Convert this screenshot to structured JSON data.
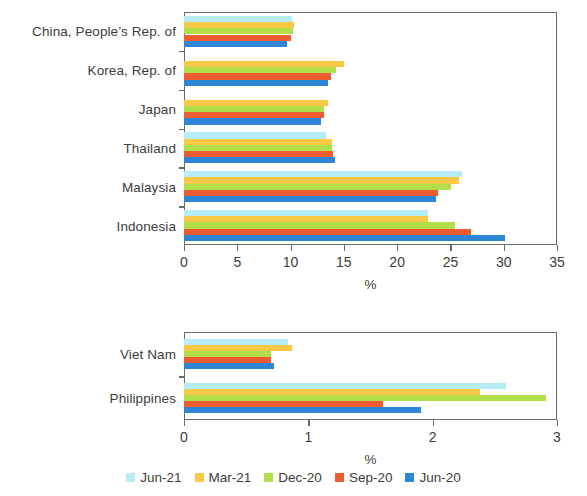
{
  "legend": {
    "position": "bottom-center",
    "entries": [
      {
        "label": "Jun-21",
        "color": "#b6ecf5"
      },
      {
        "label": "Mar-21",
        "color": "#f9c846"
      },
      {
        "label": "Dec-20",
        "color": "#b2de4a"
      },
      {
        "label": "Sep-20",
        "color": "#f05c32"
      },
      {
        "label": "Jun-20",
        "color": "#2e86d6"
      }
    ]
  },
  "chart_data": [
    {
      "type": "bar",
      "orientation": "horizontal",
      "panel": "top",
      "title": "",
      "xlabel": "%",
      "ylabel": "",
      "xlim": [
        0,
        35
      ],
      "xticks": [
        0,
        5,
        10,
        15,
        20,
        25,
        30,
        35
      ],
      "grid": false,
      "categories": [
        "China, People’s Rep. of",
        "Korea, Rep. of",
        "Japan",
        "Thailand",
        "Malaysia",
        "Indonesia"
      ],
      "series": [
        {
          "name": "Jun-21",
          "color": "#b6ecf5",
          "values": [
            10.1,
            0,
            0,
            13.3,
            26.1,
            22.9
          ]
        },
        {
          "name": "Mar-21",
          "color": "#f9c846",
          "values": [
            10.3,
            15.0,
            13.5,
            13.9,
            25.8,
            22.9
          ]
        },
        {
          "name": "Dec-20",
          "color": "#b2de4a",
          "values": [
            10.2,
            14.3,
            13.1,
            13.9,
            25.1,
            25.4
          ]
        },
        {
          "name": "Sep-20",
          "color": "#f05c32",
          "values": [
            10.0,
            13.8,
            13.1,
            14.0,
            23.8,
            26.9
          ]
        },
        {
          "name": "Jun-20",
          "color": "#2e86d6",
          "values": [
            9.7,
            13.5,
            12.9,
            14.2,
            23.6,
            30.1
          ]
        }
      ]
    },
    {
      "type": "bar",
      "orientation": "horizontal",
      "panel": "bottom",
      "title": "",
      "xlabel": "%",
      "ylabel": "",
      "xlim": [
        0,
        3
      ],
      "xticks": [
        0,
        1,
        2,
        3
      ],
      "grid": false,
      "categories": [
        "Viet Nam",
        "Philippines"
      ],
      "series": [
        {
          "name": "Jun-21",
          "color": "#b6ecf5",
          "values": [
            0.84,
            2.59
          ]
        },
        {
          "name": "Mar-21",
          "color": "#f9c846",
          "values": [
            0.87,
            2.38
          ]
        },
        {
          "name": "Dec-20",
          "color": "#b2de4a",
          "values": [
            0.7,
            2.91
          ]
        },
        {
          "name": "Sep-20",
          "color": "#f05c32",
          "values": [
            0.7,
            1.6
          ]
        },
        {
          "name": "Jun-20",
          "color": "#2e86d6",
          "values": [
            0.72,
            1.91
          ]
        }
      ]
    }
  ]
}
